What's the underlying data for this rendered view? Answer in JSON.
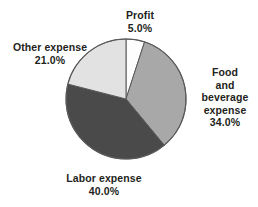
{
  "figure": {
    "background_color": "#ffffff",
    "width": 258,
    "height": 207
  },
  "chart_data": {
    "type": "pie",
    "title": "",
    "subtitle": "",
    "xlabel": "",
    "ylabel": "",
    "grid": false,
    "legend_position": "none",
    "label_format": "name above percentage, placed outside slice",
    "start_angle_deg": 0,
    "direction": "clockwise",
    "center": {
      "x": 126,
      "y": 99
    },
    "radius": 60,
    "outline_color": "#595959",
    "categories": [
      "Profit",
      "Food and beverage expense",
      "Labor expense",
      "Other expense"
    ],
    "values": [
      5.0,
      34.0,
      40.0,
      21.0
    ],
    "value_labels": [
      "5.0%",
      "34.0%",
      "40.0%",
      "21.0%"
    ],
    "colors": [
      "#fdfdfd",
      "#a8a8a8",
      "#4a4a4a",
      "#e2e2e2"
    ],
    "slices": [
      {
        "name": "Profit",
        "value": 5.0,
        "value_label": "5.0%",
        "color": "#fdfdfd",
        "start_angle_deg": 0,
        "end_angle_deg": 18
      },
      {
        "name": "Food and beverage expense",
        "value": 34.0,
        "value_label": "34.0%",
        "color": "#a8a8a8",
        "start_angle_deg": 18,
        "end_angle_deg": 140.4
      },
      {
        "name": "Labor expense",
        "value": 40.0,
        "value_label": "40.0%",
        "color": "#4a4a4a",
        "start_angle_deg": 140.4,
        "end_angle_deg": 284.4
      },
      {
        "name": "Other expense",
        "value": 21.0,
        "value_label": "21.0%",
        "color": "#e2e2e2",
        "start_angle_deg": 284.4,
        "end_angle_deg": 360
      }
    ]
  },
  "labels": {
    "profit": {
      "name": "Profit",
      "value": "5.0%"
    },
    "food": {
      "name": "Food and beverage expense",
      "value": "34.0%"
    },
    "labor": {
      "name": "Labor expense",
      "value": "40.0%"
    },
    "other": {
      "name": "Other expense",
      "value": "21.0%"
    }
  }
}
